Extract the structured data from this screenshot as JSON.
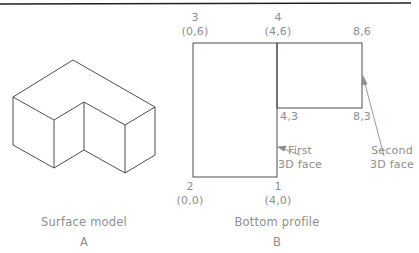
{
  "colors": {
    "line": "#3a3a3a",
    "text": "#8e8e8e",
    "arrow": "#8e8e8e",
    "rule": "#222222"
  },
  "figure_a": {
    "caption": "Surface model",
    "letter": "A"
  },
  "figure_b": {
    "caption": "Bottom profile",
    "letter": "B",
    "points": {
      "p3": {
        "num": "3",
        "coord": "(0,6)"
      },
      "p4": {
        "num": "4",
        "coord": "(4,6)"
      },
      "p2": {
        "num": "2",
        "coord": "(0,0)"
      },
      "p1": {
        "num": "1",
        "coord": "(4,0)"
      },
      "p86": "8,6",
      "p43": "4,3",
      "p83": "8,3"
    },
    "callouts": {
      "first": {
        "line1": "First",
        "line2": "3D face"
      },
      "second": {
        "line1": "Second",
        "line2": "3D face"
      }
    }
  }
}
